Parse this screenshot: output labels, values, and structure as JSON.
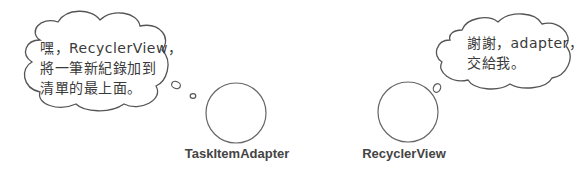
{
  "left_bubble": {
    "lines": [
      "嘿，RecyclerView，",
      "將一筆新紀錄加到",
      "清單的最上面。"
    ]
  },
  "right_bubble": {
    "lines": [
      "謝謝，adapter，",
      "交給我。"
    ]
  },
  "actors": [
    {
      "name": "TaskItemAdapter"
    },
    {
      "name": "RecyclerView"
    }
  ],
  "colors": {
    "stroke": "#555555",
    "text": "#3a3a3a"
  }
}
